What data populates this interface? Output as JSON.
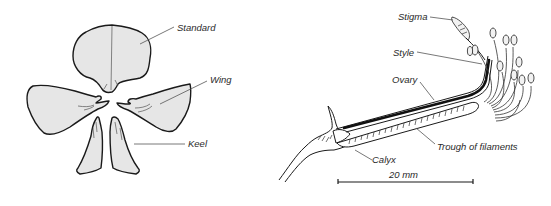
{
  "figure": {
    "left_panel": {
      "name": "flower-petals",
      "labels": {
        "standard": "Standard",
        "wing": "Wing",
        "keel": "Keel"
      }
    },
    "right_panel": {
      "name": "stamen-and-pistil-column",
      "labels": {
        "stigma": "Stigma",
        "style": "Style",
        "ovary": "Ovary",
        "trough": "Trough of filaments",
        "calyx": "Calyx"
      },
      "scale_bar": {
        "label": "20 mm"
      }
    },
    "colors": {
      "petal_fill": "#e6e6e6",
      "outline": "#1a1a1a",
      "label_text": "#2a2a2a"
    }
  }
}
